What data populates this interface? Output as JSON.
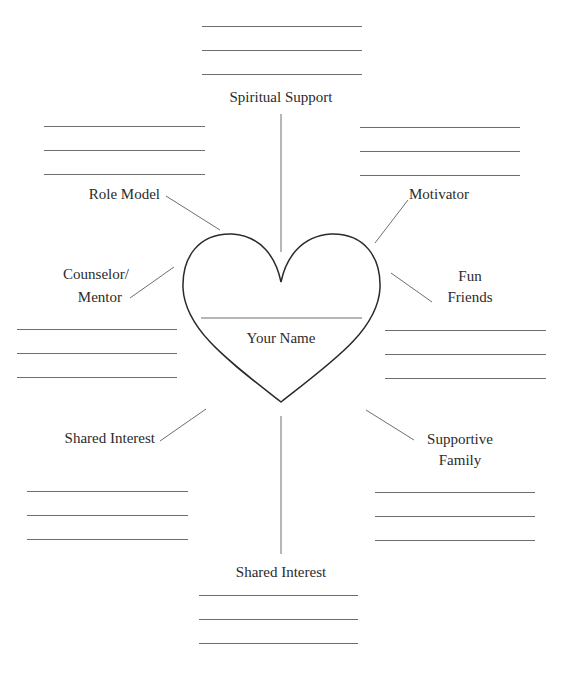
{
  "diagram": {
    "type": "support-network-worksheet",
    "center": {
      "shape": "heart",
      "label": "Your Name"
    },
    "branches": [
      {
        "id": "top",
        "label": "Spiritual Support",
        "lines": 3
      },
      {
        "id": "top-left",
        "label": "Role Model",
        "lines": 3
      },
      {
        "id": "top-right",
        "label": "Motivator",
        "lines": 3
      },
      {
        "id": "mid-left",
        "label_line1": "Counselor/",
        "label_line2": "Mentor",
        "lines": 3
      },
      {
        "id": "mid-right",
        "label_line1": "Fun",
        "label_line2": "Friends",
        "lines": 3
      },
      {
        "id": "bottom-left",
        "label": "Shared Interest",
        "lines": 3
      },
      {
        "id": "bottom-right",
        "label_line1": "Supportive",
        "label_line2": "Family",
        "lines": 3
      },
      {
        "id": "bottom",
        "label": "Shared Interest",
        "lines": 3
      }
    ],
    "colors": {
      "line": "#6e6e6e",
      "heart_stroke": "#2a2a2a",
      "text": "#2b2b2b",
      "background": "#ffffff"
    }
  }
}
